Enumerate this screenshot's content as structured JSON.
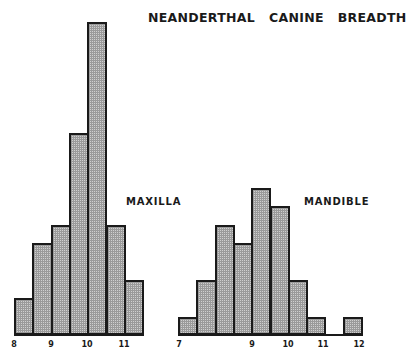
{
  "chart_data": [
    {
      "type": "bar",
      "title": "NEANDERTHAL   CANINE   BREADTH",
      "panel_label": "MAXILLA",
      "xlabel": "",
      "ylabel": "",
      "bin_width": 0.5,
      "bin_start": 8.0,
      "categories": [
        "8.0-8.5",
        "8.5-9.0",
        "9.0-9.5",
        "9.5-10.0",
        "10.0-10.5",
        "10.5-11.0",
        "11.0-11.5"
      ],
      "values": [
        2,
        5,
        6,
        11,
        17,
        6,
        3
      ],
      "xticks": [
        "8",
        "9",
        "10",
        "11"
      ],
      "grid": false
    },
    {
      "type": "bar",
      "panel_label": "MANDIBLE",
      "xlabel": "",
      "ylabel": "",
      "bin_width": 0.5,
      "bin_start": 7.0,
      "categories": [
        "7.0-7.5",
        "7.5-8.0",
        "8.0-8.5",
        "8.5-9.0",
        "9.0-9.5",
        "9.5-10.0",
        "10.0-10.5",
        "10.5-11.0",
        "11.0-11.5",
        "11.5-12.0"
      ],
      "values": [
        1,
        3,
        6,
        5,
        8,
        7,
        3,
        1,
        0,
        1
      ],
      "xticks": [
        "7",
        "9",
        "10",
        "11",
        "12"
      ],
      "grid": false
    }
  ],
  "title": "NEANDERTHAL   CANINE   BREADTH",
  "maxilla": {
    "label": "MAXILLA",
    "ticks": [
      {
        "text": "8",
        "x": 14
      },
      {
        "text": "9",
        "x": 51
      },
      {
        "text": "10",
        "x": 87
      },
      {
        "text": "11",
        "x": 124
      }
    ]
  },
  "mandible": {
    "label": "MANDIBLE",
    "ticks": [
      {
        "text": "7",
        "x": 179
      },
      {
        "text": "9",
        "x": 252
      },
      {
        "text": "10",
        "x": 288
      },
      {
        "text": "11",
        "x": 323
      },
      {
        "text": "12",
        "x": 359
      }
    ]
  }
}
